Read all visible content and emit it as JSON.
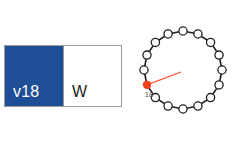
{
  "canvas": {
    "width": 235,
    "height": 151,
    "background": "#ffffff"
  },
  "swatch_panel": {
    "name": "two-tone color swatch",
    "border_color": "#9a9a9a",
    "left": {
      "label": "v18",
      "fill": "#1d4e96",
      "text_color": "#ffffff"
    },
    "right": {
      "label": "W",
      "fill": "#ffffff",
      "text_color": "#231f20"
    }
  },
  "dial": {
    "name": "circular position dial",
    "node_count": 16,
    "active_index": 11,
    "active_label": "18",
    "ring_color": "#231f20",
    "node_fill": "#ffffff",
    "node_stroke": "#231f20",
    "active_color": "#f4411e",
    "pointer_color": "#f4562c",
    "label_color": "#55524f",
    "geometry": {
      "cx": 50,
      "cy": 48,
      "radius": 39,
      "node_radius": 4.1,
      "pointer_start_x": 48,
      "pointer_start_y": 50,
      "start_angle_deg": -90
    }
  }
}
